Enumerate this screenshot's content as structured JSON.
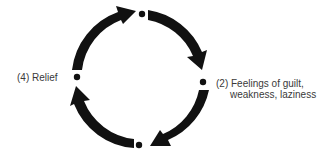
{
  "diagram": {
    "type": "cycle",
    "direction": "clockwise",
    "colors": {
      "arrow": "#111111",
      "node": "#111111",
      "text": "#3a3a3a"
    },
    "nodes": [
      {
        "position": "top",
        "label": ""
      },
      {
        "position": "right",
        "label_line1": "(2) Feelings of guilt,",
        "label_line2": "weakness, laziness"
      },
      {
        "position": "bottom",
        "label": ""
      },
      {
        "position": "left",
        "label": "(4) Relief"
      }
    ]
  }
}
